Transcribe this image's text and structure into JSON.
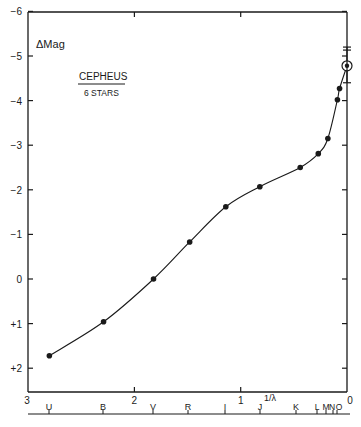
{
  "figure": {
    "ylabel": "ΔMag",
    "title": "CEPHEUS",
    "subtitle": "6 STARS",
    "xlabel": "1/λ",
    "caption": "FIG. 21.—The interstellar extinction curve"
  },
  "chart_data": {
    "type": "line",
    "xlabel": "1/λ",
    "ylabel": "ΔMag",
    "xlim": [
      3,
      0
    ],
    "ylim": [
      2.5,
      -6
    ],
    "x_ticks": [
      "3",
      "2",
      "1",
      "0"
    ],
    "y_ticks": [
      "-6",
      "-5",
      "-4",
      "-3",
      "-2",
      "-1",
      "0",
      "+1",
      "+2"
    ],
    "band_labels": [
      "U",
      "B",
      "V",
      "R",
      "I",
      "J",
      "K",
      "L",
      "M",
      "N",
      "O"
    ],
    "grid": false,
    "series": [
      {
        "name": "Cepheus (6 stars)",
        "points": [
          {
            "band": "U",
            "x": 2.8,
            "y": 1.72
          },
          {
            "band": "B",
            "x": 2.29,
            "y": 0.96
          },
          {
            "band": "V",
            "x": 1.82,
            "y": 0.0
          },
          {
            "band": "R",
            "x": 1.48,
            "y": -0.83
          },
          {
            "band": "I",
            "x": 1.14,
            "y": -1.62
          },
          {
            "band": "J",
            "x": 0.82,
            "y": -2.07
          },
          {
            "band": "K",
            "x": 0.44,
            "y": -2.5
          },
          {
            "band": "L",
            "x": 0.27,
            "y": -2.81
          },
          {
            "band": "M",
            "x": 0.18,
            "y": -3.15
          },
          {
            "band": "N",
            "x": 0.09,
            "y": -4.02
          },
          {
            "band": "N",
            "x": 0.07,
            "y": -4.27
          },
          {
            "band": "O",
            "x": 0.0,
            "y": -4.78,
            "marker": "circled",
            "error": [
              -5.2,
              -4.4
            ]
          }
        ]
      }
    ]
  }
}
